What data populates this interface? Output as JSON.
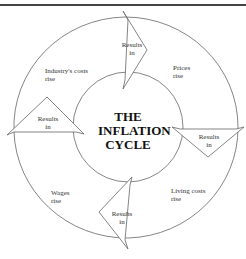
{
  "diagram": {
    "title_lines": [
      "THE",
      "INFLATION",
      "CYCLE"
    ],
    "stages": [
      {
        "label_lines": [
          "Prices",
          "rise"
        ]
      },
      {
        "label_lines": [
          "Living costs",
          "rise"
        ]
      },
      {
        "label_lines": [
          "Wages",
          "rise"
        ]
      },
      {
        "label_lines": [
          "Industry's costs",
          "rise"
        ]
      }
    ],
    "arrows": [
      {
        "label_lines": [
          "Results",
          "in"
        ]
      },
      {
        "label_lines": [
          "Results",
          "in"
        ]
      },
      {
        "label_lines": [
          "Results",
          "in"
        ]
      },
      {
        "label_lines": [
          "Results",
          "in"
        ]
      }
    ],
    "colors": {
      "line": "#555555",
      "text": "#333333",
      "rule": "#444444"
    }
  }
}
